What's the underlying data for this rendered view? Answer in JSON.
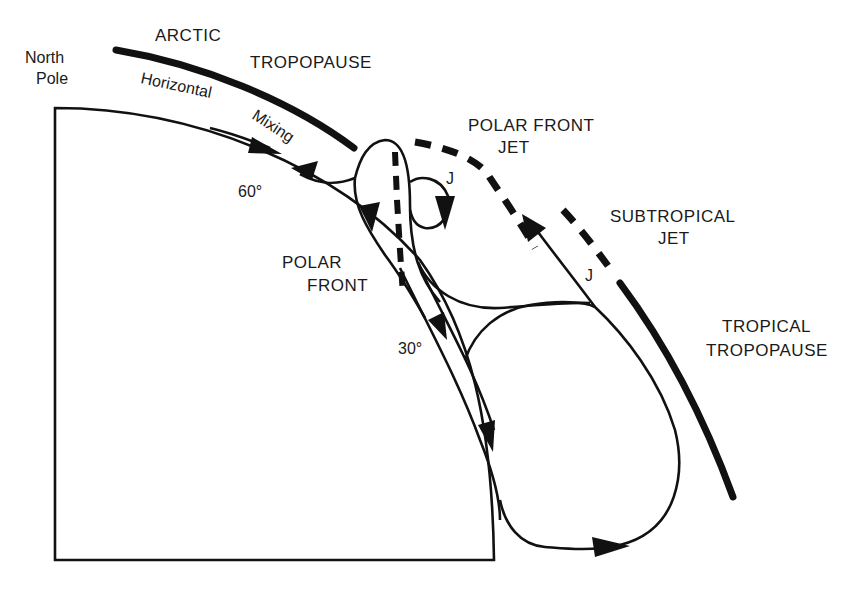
{
  "figure": {
    "labels": {
      "north_pole": [
        "North",
        "Pole"
      ],
      "arctic_tropopause": [
        "ARCTIC",
        "TROPOPAUSE"
      ],
      "horizontal_mixing": [
        "Horizontal",
        "Mixing"
      ],
      "polar_front_jet": [
        "POLAR FRONT",
        "JET"
      ],
      "subtropical_jet": [
        "SUBTROPICAL",
        "JET"
      ],
      "tropical_tropopause": [
        "TROPICAL",
        "TROPOPAUSE"
      ],
      "polar_front": [
        "POLAR",
        "FRONT"
      ],
      "lat_60": "60°",
      "lat_30": "30°",
      "jet_marker_polar": "J",
      "jet_marker_subtropical": "J"
    },
    "colors": {
      "ink": "#111111",
      "background": "#ffffff"
    }
  }
}
